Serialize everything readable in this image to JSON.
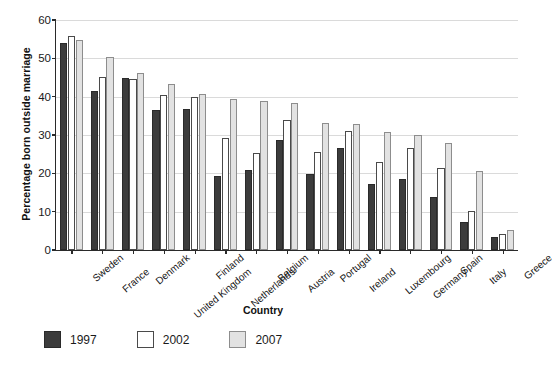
{
  "chart_data": {
    "type": "bar",
    "title": "",
    "xlabel": "Country",
    "ylabel": "Percentage born outside marriage",
    "ylim": [
      0,
      60
    ],
    "yticks": [
      0,
      10,
      20,
      30,
      40,
      50,
      60
    ],
    "grid": true,
    "legend_position": "bottom-left",
    "categories": [
      "Sweden",
      "France",
      "Denmark",
      "United Kingdom",
      "Finland",
      "Netherlands",
      "Belgium",
      "Austria",
      "Portugal",
      "Ireland",
      "Luxembourg",
      "Germany",
      "Spain",
      "Italy",
      "Greece"
    ],
    "series": [
      {
        "name": "1997",
        "color": "#3c3c3c",
        "values": [
          53.9,
          41.5,
          44.8,
          36.4,
          36.7,
          19.3,
          21.0,
          28.8,
          19.8,
          26.6,
          17.2,
          18.5,
          13.7,
          7.2,
          3.3
        ]
      },
      {
        "name": "2002",
        "color": "#ffffff",
        "values": [
          55.9,
          45.2,
          44.5,
          40.4,
          39.9,
          29.1,
          25.3,
          33.8,
          25.5,
          31.1,
          22.9,
          26.6,
          21.5,
          10.1,
          4.2
        ]
      },
      {
        "name": "2007",
        "color": "#e2e2e2",
        "values": [
          54.7,
          50.4,
          46.1,
          43.4,
          40.6,
          39.5,
          39.0,
          38.3,
          33.1,
          32.8,
          30.8,
          30.0,
          28.0,
          20.7,
          5.1
        ]
      }
    ]
  },
  "legend": {
    "items": [
      {
        "label": "1997",
        "swatch": "y1997"
      },
      {
        "label": "2002",
        "swatch": "y2002"
      },
      {
        "label": "2007",
        "swatch": "y2007"
      }
    ]
  }
}
